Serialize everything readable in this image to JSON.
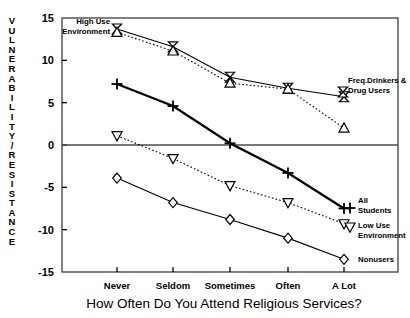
{
  "chart_data": {
    "type": "line",
    "title": "",
    "xlabel": "How Often Do You Attend Religious Services?",
    "ylabel": "VULNERABILITY/RESISTANCE",
    "categories": [
      "Never",
      "Seldom",
      "Sometimes",
      "Often",
      "A Lot"
    ],
    "ylim": [
      -15,
      15
    ],
    "yticks": [
      15,
      10,
      5,
      0,
      -5,
      -10,
      -15
    ],
    "ytick_labels": [
      "15",
      "10",
      "5",
      "0",
      "-5",
      "-10",
      "-15"
    ],
    "grid": false,
    "legend_position": "inline-annotations",
    "zero_line": true,
    "series": [
      {
        "name": "Freq.Drinkers & Drug Users",
        "marker": "bowtie",
        "line": "solid",
        "values": [
          13.7,
          11.6,
          8.0,
          6.7,
          5.7
        ]
      },
      {
        "name": "High Use Environment",
        "marker": "triangle-up",
        "line": "dotted",
        "values": [
          13.3,
          11.1,
          7.3,
          6.6,
          2.0
        ]
      },
      {
        "name": "All Students",
        "marker": "plus",
        "line": "solid-thick",
        "values": [
          7.2,
          4.6,
          0.2,
          -3.3,
          -7.5
        ]
      },
      {
        "name": "Low Use Environment",
        "marker": "triangle-down",
        "line": "dotted",
        "values": [
          1.1,
          -1.6,
          -4.8,
          -6.8,
          -9.3
        ]
      },
      {
        "name": "Nonusers",
        "marker": "diamond",
        "line": "solid",
        "values": [
          -3.9,
          -6.8,
          -8.8,
          -11.0,
          -13.5
        ]
      }
    ],
    "annotations": [
      {
        "id": "high-use-environment",
        "text_line1": "High Use",
        "text_line2": "Environment"
      },
      {
        "id": "freq-drinkers",
        "text_line1": "Freq.Drinkers &",
        "text_line2": "Drug Users"
      },
      {
        "id": "all-students",
        "text_line1": "All",
        "text_line2": "Students"
      },
      {
        "id": "low-use-environment",
        "text_line1": "Low Use",
        "text_line2": "Environment"
      },
      {
        "id": "nonusers",
        "text_line1": "Nonusers",
        "text_line2": ""
      }
    ]
  },
  "axis": {
    "y_label_letters": [
      "V",
      "U",
      "L",
      "N",
      "E",
      "R",
      "A",
      "B",
      "I",
      "L",
      "I",
      "T",
      "Y",
      "/",
      "R",
      "E",
      "S",
      "I",
      "S",
      "T",
      "A",
      "N",
      "C",
      "E"
    ]
  },
  "colors": {
    "ink": "#000000",
    "background": "#ffffff",
    "frame": "#4a4a4a"
  }
}
